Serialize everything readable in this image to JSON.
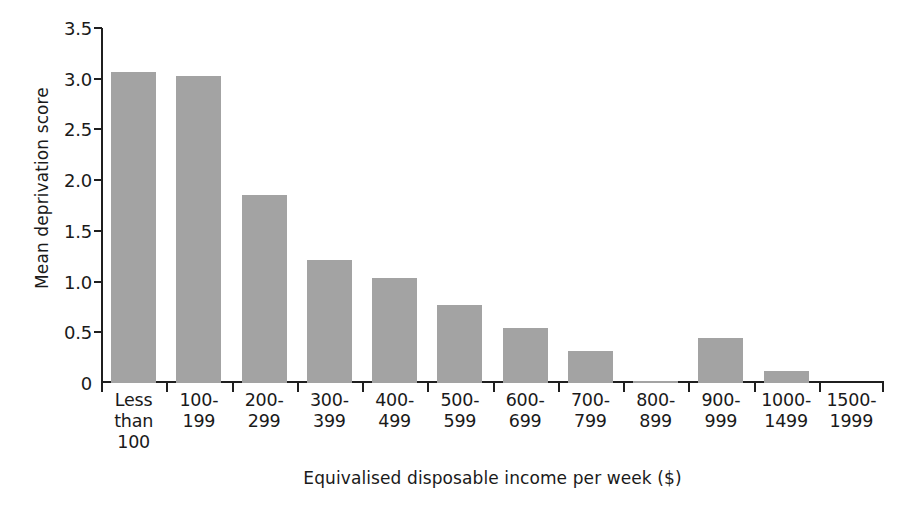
{
  "chart_data": {
    "type": "bar",
    "title": "",
    "xlabel": "Equivalised disposable income per week ($)",
    "ylabel": "Mean deprivation score",
    "ylim": [
      0,
      3.5
    ],
    "ytick_values": [
      0,
      0.5,
      1.0,
      1.5,
      2.0,
      2.5,
      3.0,
      3.5
    ],
    "ytick_labels": [
      "0",
      "0.5",
      "1.0",
      "1.5",
      "2.0",
      "2.5",
      "3.0",
      "3.5"
    ],
    "grid": false,
    "legend": null,
    "bar_color": "#a3a3a3",
    "axis_color": "#1f1f1f",
    "text_color": "#1a1a1a",
    "categories": [
      "Less than 100",
      "100-199",
      "200-299",
      "300-399",
      "400-499",
      "500-599",
      "600-699",
      "700-799",
      "800-899",
      "900-999",
      "1000-1499",
      "1500-1999"
    ],
    "category_lines": [
      [
        "Less",
        "than",
        "100"
      ],
      [
        "100-",
        "199"
      ],
      [
        "200-",
        "299"
      ],
      [
        "300-",
        "399"
      ],
      [
        "400-",
        "499"
      ],
      [
        "500-",
        "599"
      ],
      [
        "600-",
        "699"
      ],
      [
        "700-",
        "799"
      ],
      [
        "800-",
        "899"
      ],
      [
        "900-",
        "999"
      ],
      [
        "1000-",
        "1499"
      ],
      [
        "1500-",
        "1999"
      ]
    ],
    "values": [
      3.07,
      3.03,
      1.85,
      1.21,
      1.04,
      0.77,
      0.54,
      0.32,
      0.02,
      0.44,
      0.12,
      0.0
    ]
  }
}
